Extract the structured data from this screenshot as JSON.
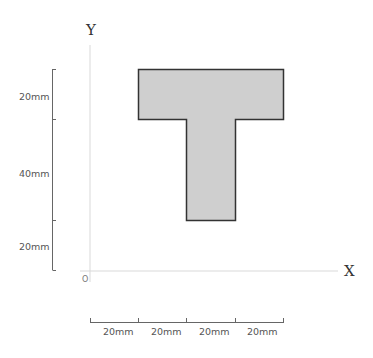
{
  "diagram": {
    "type": "cross-section",
    "shape": "T-section",
    "axes": {
      "x_label": "X",
      "y_label": "Y",
      "origin_label": "O"
    },
    "vertical_dimensions": [
      {
        "label": "20mm",
        "segment": "flange thickness"
      },
      {
        "label": "40mm",
        "segment": "web height"
      },
      {
        "label": "20mm",
        "segment": "offset from X axis"
      }
    ],
    "horizontal_dimensions": [
      {
        "label": "20mm"
      },
      {
        "label": "20mm"
      },
      {
        "label": "20mm"
      },
      {
        "label": "20mm"
      }
    ],
    "colors": {
      "shape_fill": "#cfcfcf",
      "shape_stroke": "#333333",
      "axis": "#d9d9d9",
      "dimension_line": "#666666",
      "text": "#555555"
    }
  }
}
